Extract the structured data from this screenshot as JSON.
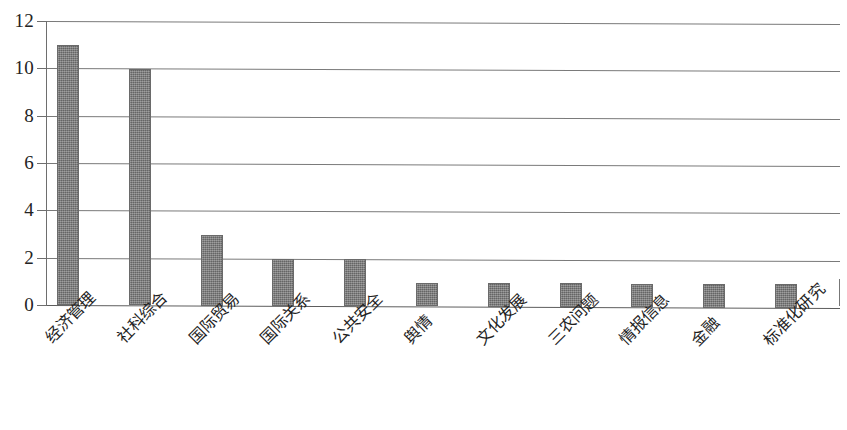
{
  "chart_data": {
    "type": "bar",
    "title": "",
    "subtitle": "",
    "xlabel": "",
    "ylabel": "",
    "categories": [
      "经济管理",
      "社科综合",
      "国际贸易",
      "国际关系",
      "公共安全",
      "舆情",
      "文化发展",
      "三农问题",
      "情报信息",
      "金融",
      "标准化研究"
    ],
    "values": [
      11,
      10,
      3,
      2,
      2,
      1,
      1,
      1,
      1,
      1,
      1
    ],
    "ylim": [
      0,
      12
    ],
    "yticks": [
      0,
      2,
      4,
      6,
      8,
      10,
      12
    ],
    "ytick_labels": [
      "0",
      "2",
      "4",
      "6",
      "8",
      "10",
      "12"
    ],
    "grid": true,
    "grid_axis": "y",
    "legend": false,
    "legend_position": "none",
    "bar_color": "#7b7b7b",
    "bar_edge_color": "#6a6a6a",
    "grid_color": "#7a7a7a",
    "axis_color": "#6e6e6e",
    "background_color": "#ffffff",
    "label_rotation": -45
  }
}
